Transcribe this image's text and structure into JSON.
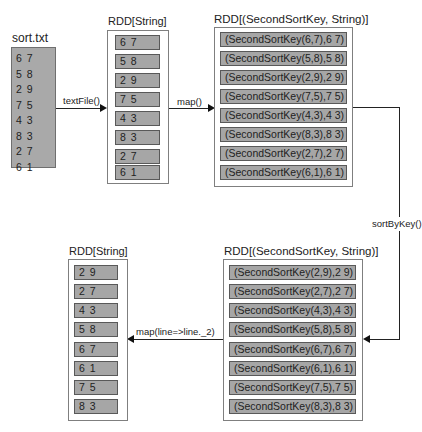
{
  "nodes": {
    "source_file": {
      "title": "sort.txt",
      "lines": [
        "6 7",
        "5 8",
        "2 9",
        "7 5",
        "4 3",
        "8 3",
        "2 7",
        "6 1"
      ]
    },
    "rdd_string_1": {
      "title": "RDD[String]",
      "items": [
        "6 7",
        "5 8",
        "2 9",
        "7 5",
        "4 3",
        "8 3",
        "2 7",
        "6 1"
      ]
    },
    "rdd_pair_1": {
      "title": "RDD[(SecondSortKey, String)]",
      "items": [
        "(SecondSortKey(6,7),6 7)",
        "(SecondSortKey(5,8),5 8)",
        "(SecondSortKey(2,9),2 9)",
        "(SecondSortKey(7,5),7 5)",
        "(SecondSortKey(4,3),4 3)",
        "(SecondSortKey(8,3),8 3)",
        "(SecondSortKey(2,7),2 7)",
        "(SecondSortKey(6,1),6 1)"
      ]
    },
    "rdd_pair_sorted": {
      "title": "RDD[(SecondSortKey, String)]",
      "items": [
        "(SecondSortKey(2,9),2 9)",
        "(SecondSortKey(2,7),2 7)",
        "(SecondSortKey(4,3),4 3)",
        "(SecondSortKey(5,8),5 8)",
        "(SecondSortKey(6,7),6 7)",
        "(SecondSortKey(6,1),6 1)",
        "(SecondSortKey(7,5),7 5)",
        "(SecondSortKey(8,3),8 3)"
      ]
    },
    "rdd_string_result": {
      "title": "RDD[String]",
      "items": [
        "2 9",
        "2 7",
        "4 3",
        "5 8",
        "6 7",
        "6 1",
        "7 5",
        "8 3"
      ]
    }
  },
  "edges": [
    {
      "from": "source_file",
      "to": "rdd_string_1",
      "label": "textFile()"
    },
    {
      "from": "rdd_string_1",
      "to": "rdd_pair_1",
      "label": "map()"
    },
    {
      "from": "rdd_pair_1",
      "to": "rdd_pair_sorted",
      "label": "sortByKey()"
    },
    {
      "from": "rdd_pair_sorted",
      "to": "rdd_string_result",
      "label": "map(line=>line._2)"
    }
  ],
  "colors": {
    "item_fill": "#a6a6a6",
    "item_border": "#595959",
    "container_border": "#7f7f7f",
    "arrow": "#111111"
  }
}
